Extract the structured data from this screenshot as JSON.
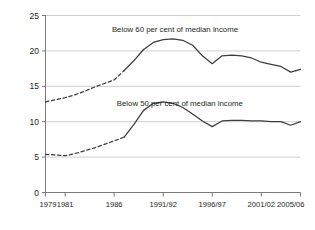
{
  "chart_data": {
    "type": "line",
    "title": "",
    "subtitle": "",
    "xlabel": "",
    "ylabel": "",
    "grid": true,
    "legend_position": "inline-annotations",
    "xlim": [
      1979,
      2005
    ],
    "ylim": [
      0,
      25
    ],
    "y_ticks": [
      "0",
      "5",
      "10",
      "15",
      "20",
      "25"
    ],
    "y_tick_values": [
      0,
      5,
      10,
      15,
      20,
      25
    ],
    "x_ticks": [
      "1979",
      "1981",
      "1986",
      "1991/92",
      "1996/97",
      "2001/02",
      "2005/06"
    ],
    "x_tick_values": [
      1979,
      1981,
      1986,
      1991,
      1996,
      2001,
      2005
    ],
    "annotations": [
      {
        "text": "Below 60 per cent of median income",
        "x": 1992.2,
        "y": 23.0
      },
      {
        "text": "Below 50 per cent of median income",
        "x": 1992.7,
        "y": 12.6
      }
    ],
    "series": [
      {
        "name": "Below 60 per cent of median income",
        "color": "#3d3d3d",
        "dashed_until": 1987,
        "x": [
          1979,
          1980,
          1981,
          1982,
          1983,
          1984,
          1985,
          1986,
          1987,
          1988,
          1989,
          1990,
          1991,
          1992,
          1993,
          1994,
          1995,
          1996,
          1997,
          1998,
          1999,
          2000,
          2001,
          2002,
          2003,
          2004,
          2005
        ],
        "values": [
          12.8,
          13.1,
          13.4,
          13.8,
          14.3,
          14.9,
          15.4,
          15.9,
          17.2,
          18.6,
          20.2,
          21.2,
          21.6,
          21.7,
          21.5,
          20.8,
          19.3,
          18.2,
          19.3,
          19.4,
          19.3,
          19.0,
          18.4,
          18.1,
          17.8,
          17.0,
          17.4
        ]
      },
      {
        "name": "Below 50 per cent of median income",
        "color": "#3d3d3d",
        "dashed_until": 1987,
        "x": [
          1979,
          1980,
          1981,
          1982,
          1983,
          1984,
          1985,
          1986,
          1987,
          1988,
          1989,
          1990,
          1991,
          1992,
          1993,
          1994,
          1995,
          1996,
          1997,
          1998,
          1999,
          2000,
          2001,
          2002,
          2003,
          2004,
          2005
        ],
        "values": [
          5.4,
          5.3,
          5.2,
          5.5,
          5.9,
          6.3,
          6.8,
          7.3,
          7.8,
          9.6,
          11.6,
          12.6,
          12.8,
          12.6,
          12.0,
          11.1,
          10.1,
          9.3,
          10.1,
          10.2,
          10.2,
          10.1,
          10.1,
          10.0,
          10.0,
          9.5,
          10.0
        ]
      }
    ]
  },
  "colors": {
    "line": "#3d3d3d",
    "grid": "#c9c9c9",
    "axis": "#7a7a7a",
    "text": "#231f20",
    "background": "#ffffff"
  }
}
